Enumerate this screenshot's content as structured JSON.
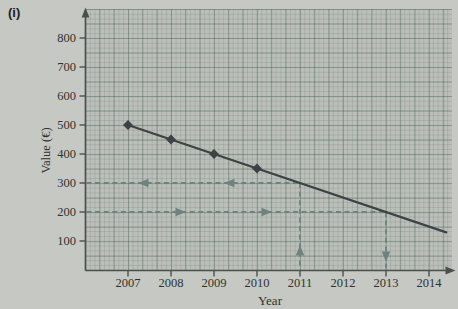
{
  "figure": {
    "panel_label": "(i)"
  },
  "chart_data": {
    "type": "line",
    "title": "",
    "xlabel": "Year",
    "ylabel": "Value (€)",
    "x_tick_labels": [
      "2007",
      "2008",
      "2009",
      "2010",
      "2011",
      "2012",
      "2013",
      "2014"
    ],
    "y_tick_labels": [
      "100",
      "200",
      "300",
      "400",
      "500",
      "600",
      "700",
      "800"
    ],
    "xlim": [
      2006,
      2014.6
    ],
    "ylim": [
      0,
      880
    ],
    "grid": "graph-paper",
    "legend_position": "none",
    "series": [
      {
        "name": "value-of-asset",
        "x": [
          2007,
          2008,
          2009,
          2010
        ],
        "y": [
          500,
          450,
          400,
          350
        ],
        "marker": "diamond",
        "line_extends_to": {
          "x": 2014.4,
          "y": 130
        },
        "slope_per_year": -50
      }
    ],
    "guide_arrows": [
      {
        "reading": "year 2011 corresponds to value 300",
        "year": 2011,
        "value": 300,
        "path": "up-from-x-axis-then-left-to-y-axis"
      },
      {
        "reading": "value 200 corresponds to year 2013",
        "year": 2013,
        "value": 200,
        "path": "right-from-y-axis-then-down-to-x-axis"
      }
    ]
  },
  "colors": {
    "background": "#c6c8c3",
    "paper": "#babfb9",
    "axis": "#4a504e",
    "series_line": "#3d4345",
    "guide_arrows": "#70827e",
    "text": "#2e3331"
  }
}
